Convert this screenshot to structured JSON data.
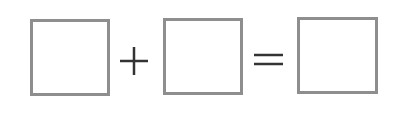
{
  "equation": {
    "operands": [
      "",
      "",
      ""
    ],
    "operators": {
      "plus": "plus-sign",
      "equals": "equals-sign"
    },
    "colors": {
      "box_border": "#8e8e8e",
      "operator": "#333333"
    }
  }
}
